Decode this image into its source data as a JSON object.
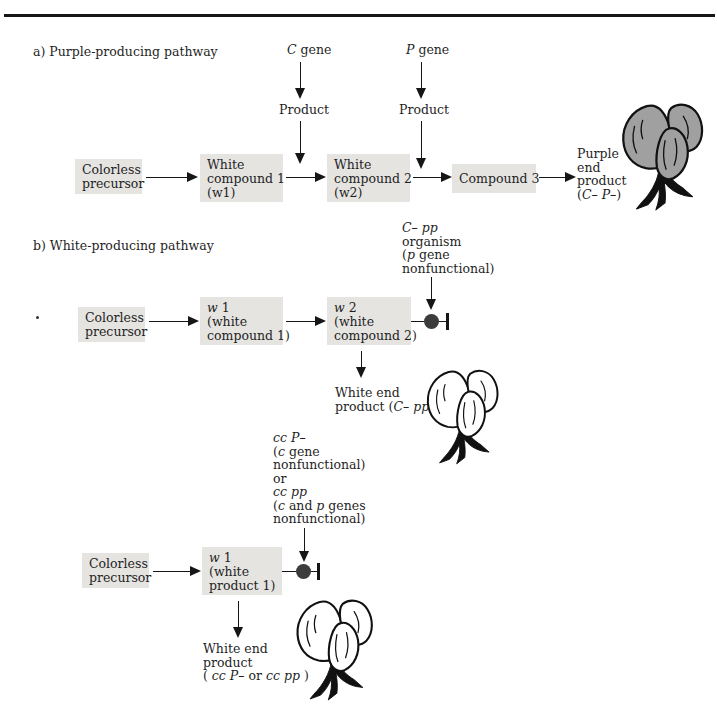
{
  "colors": {
    "ink": "#161616",
    "box_background": "#e5e4e1",
    "purple_flower_fill": "#a0a0a0",
    "white_flower_fill": "#ffffff",
    "inhibitor_circle": "#3c3c3c"
  },
  "section_a": {
    "label": "a) Purple-producing pathway",
    "gene_c": [
      {
        "t": "C",
        "i": true
      },
      {
        "t": " gene",
        "i": false
      }
    ],
    "gene_p": [
      {
        "t": "P",
        "i": true
      },
      {
        "t": " gene",
        "i": false
      }
    ],
    "product_left": "Product",
    "product_right": "Product",
    "boxes": {
      "colorless": [
        "Colorless",
        "precursor"
      ],
      "w1": [
        "White",
        "compound 1",
        "(w1)"
      ],
      "w2": [
        "White",
        "compound 2",
        "(w2)"
      ],
      "compound3": "Compound 3"
    },
    "end_product": [
      "Purple",
      "end",
      "product",
      [
        {
          "t": "(",
          "i": false
        },
        {
          "t": "C– P–",
          "i": true
        },
        {
          "t": ")",
          "i": false
        }
      ]
    ]
  },
  "section_b": {
    "label": "b) White-producing pathway",
    "inhibitor_top": [
      [
        {
          "t": "C–",
          "i": true
        },
        {
          "t": " ",
          "i": false
        },
        {
          "t": "pp",
          "i": true
        }
      ],
      "organism",
      [
        {
          "t": "(",
          "i": false
        },
        {
          "t": "p",
          "i": true
        },
        {
          "t": " gene",
          "i": false
        }
      ],
      "nonfunctional)"
    ],
    "row1": {
      "colorless": [
        "Colorless",
        "precursor"
      ],
      "w1": [
        [
          {
            "t": "w",
            "i": true
          },
          {
            "t": " 1",
            "i": false
          }
        ],
        "(white",
        "compound 1)"
      ],
      "w2": [
        [
          {
            "t": "w",
            "i": true
          },
          {
            "t": " 2",
            "i": false
          }
        ],
        "(white",
        "compound 2)"
      ]
    },
    "end_product1": [
      "White end",
      [
        {
          "t": "product (",
          "i": false
        },
        {
          "t": "C– pp",
          "i": true
        },
        {
          "t": ")",
          "i": false
        }
      ]
    ],
    "inhibitor_mid": [
      [
        {
          "t": "cc P–",
          "i": true
        }
      ],
      [
        {
          "t": "(",
          "i": false
        },
        {
          "t": "c",
          "i": true
        },
        {
          "t": " gene",
          "i": false
        }
      ],
      "nonfunctional)",
      "or",
      [
        {
          "t": "cc pp",
          "i": true
        }
      ],
      [
        {
          "t": "(",
          "i": false
        },
        {
          "t": "c",
          "i": true
        },
        {
          "t": " and ",
          "i": false
        },
        {
          "t": "p",
          "i": true
        },
        {
          "t": " genes",
          "i": false
        }
      ],
      "nonfunctional)"
    ],
    "row2": {
      "colorless": [
        "Colorless",
        "precursor"
      ],
      "w1": [
        [
          {
            "t": "w",
            "i": true
          },
          {
            "t": " 1",
            "i": false
          }
        ],
        "(white",
        "product 1)"
      ]
    },
    "end_product2": [
      "White end",
      "product",
      [
        {
          "t": "( ",
          "i": false
        },
        {
          "t": "cc P–",
          "i": true
        },
        {
          "t": " or ",
          "i": false
        },
        {
          "t": "cc pp",
          "i": true
        },
        {
          "t": " )",
          "i": false
        }
      ]
    ]
  }
}
